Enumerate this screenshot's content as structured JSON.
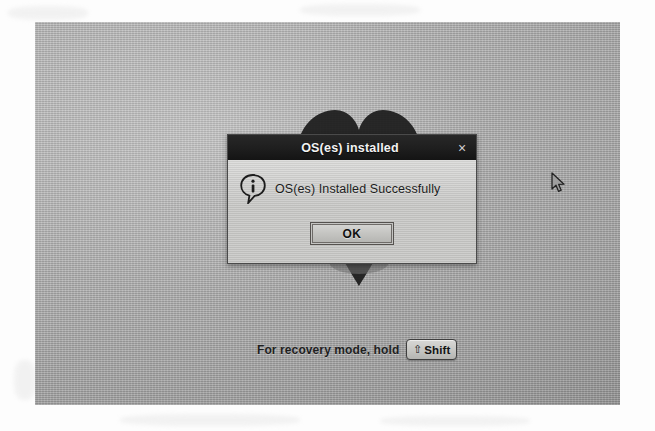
{
  "screen": {
    "background_color": "#b2b2b2",
    "logo": {
      "name": "heart-logo",
      "color": "#1b1b1b"
    },
    "cursor": {
      "name": "mouse-pointer",
      "x": 516,
      "y": 150
    }
  },
  "dialog": {
    "title": "OS(es) installed",
    "close_label": "×",
    "icon": "info-icon",
    "message": "OS(es) Installed Successfully",
    "buttons": [
      {
        "name": "ok-button",
        "label": "OK",
        "focused": true
      }
    ],
    "title_bar_color": "#1e1e1e",
    "body_color": "#c8c8c6"
  },
  "recovery": {
    "text": "For recovery mode, hold",
    "key": {
      "arrow_glyph": "⇧",
      "label": "Shift"
    }
  }
}
